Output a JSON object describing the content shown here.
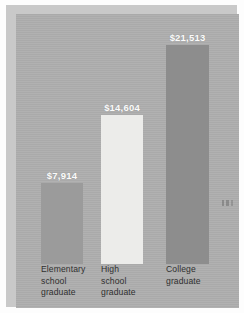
{
  "chart_data": {
    "type": "bar",
    "title": "",
    "subtitle": "",
    "xlabel": "",
    "ylabel": "",
    "categories": [
      "Elementary\nschool\ngraduate",
      "High\nschool\ngraduate",
      "College\ngraduate"
    ],
    "values": [
      7914,
      14604,
      21513
    ],
    "data_labels": [
      "$7,914",
      "$14,604",
      "$21,513"
    ],
    "ylim": [
      0,
      24000
    ],
    "grid": false,
    "legend": "none",
    "series": [
      {
        "name": "Median income",
        "values": [
          7914,
          14604,
          21513
        ]
      }
    ],
    "bar_colors": [
      "#9b9b9b",
      "#ececea",
      "#8d8d8d"
    ],
    "value_label_color": "#fbfbfb",
    "category_label_color": "#2f2f2f",
    "panel_color": "#aeaeae"
  },
  "figure": {
    "background_color": "#fdfdfd",
    "frame_color": "#c9c9c9",
    "artifact_name": "scan-speck"
  }
}
